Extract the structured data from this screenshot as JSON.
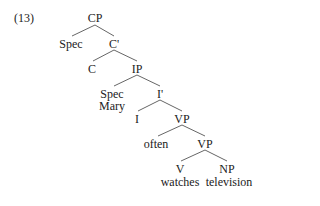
{
  "example_number": "(13)",
  "tree": {
    "nodes": [
      {
        "id": "cp",
        "label": "CP",
        "x": 95,
        "y": 12
      },
      {
        "id": "spec1",
        "label": "Spec",
        "x": 71,
        "y": 38
      },
      {
        "id": "cbar",
        "label": "C'",
        "x": 114,
        "y": 38
      },
      {
        "id": "c",
        "label": "C",
        "x": 92,
        "y": 63
      },
      {
        "id": "ip",
        "label": "IP",
        "x": 137,
        "y": 63
      },
      {
        "id": "spec2",
        "label": "Spec",
        "x": 112,
        "y": 88
      },
      {
        "id": "mary",
        "label": "Mary",
        "x": 112,
        "y": 100
      },
      {
        "id": "ibar",
        "label": "I'",
        "x": 160,
        "y": 88
      },
      {
        "id": "i",
        "label": "I",
        "x": 137,
        "y": 113
      },
      {
        "id": "vp1",
        "label": "VP",
        "x": 182,
        "y": 113
      },
      {
        "id": "often",
        "label": "often",
        "x": 156,
        "y": 138
      },
      {
        "id": "vp2",
        "label": "VP",
        "x": 205,
        "y": 138
      },
      {
        "id": "v",
        "label": "V",
        "x": 180,
        "y": 163
      },
      {
        "id": "np",
        "label": "NP",
        "x": 227,
        "y": 163
      },
      {
        "id": "watches",
        "label": "watches",
        "x": 180,
        "y": 176
      },
      {
        "id": "television",
        "label": "television",
        "x": 229,
        "y": 176
      }
    ],
    "edges": [
      [
        "cp",
        "spec1"
      ],
      [
        "cp",
        "cbar"
      ],
      [
        "cbar",
        "c"
      ],
      [
        "cbar",
        "ip"
      ],
      [
        "ip",
        "spec2"
      ],
      [
        "ip",
        "ibar"
      ],
      [
        "ibar",
        "i"
      ],
      [
        "ibar",
        "vp1"
      ],
      [
        "vp1",
        "often"
      ],
      [
        "vp1",
        "vp2"
      ],
      [
        "vp2",
        "v"
      ],
      [
        "vp2",
        "np"
      ]
    ]
  }
}
